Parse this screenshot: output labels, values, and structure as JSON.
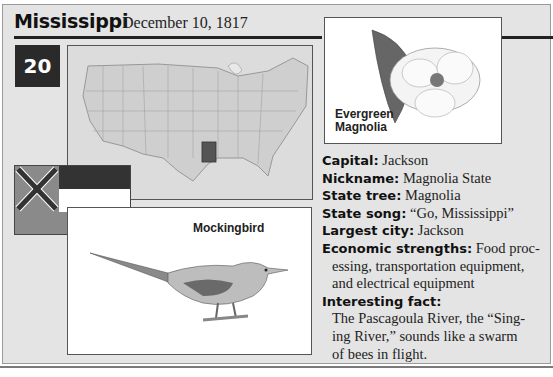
{
  "header": {
    "state_name": "Mississippi",
    "statehood_date": "December 10, 1817",
    "state_number": "20"
  },
  "images": {
    "map": {
      "description": "US map with Mississippi highlighted",
      "highlight_color": "#555555"
    },
    "flag": {
      "description": "Mississippi state flag"
    },
    "bird": {
      "label": "Mockingbird"
    },
    "flower": {
      "label_line1": "Evergreen",
      "label_line2": "Magnolia"
    }
  },
  "facts": {
    "capital": {
      "label": "Capital:",
      "value": "Jackson"
    },
    "nickname": {
      "label": "Nickname:",
      "value": "Magnolia State"
    },
    "state_tree": {
      "label": "State tree:",
      "value": "Magnolia"
    },
    "state_song": {
      "label": "State song:",
      "value": "“Go, Mississippi”"
    },
    "largest_city": {
      "label": "Largest city:",
      "value": "Jackson"
    },
    "economic_strengths": {
      "label": "Economic strengths:",
      "value_line1": "Food proc-",
      "value_line2": "essing, transportation equipment,",
      "value_line3": "and electrical equipment"
    },
    "interesting_fact": {
      "label": "Interesting fact:",
      "line1": "The Pascagoula River, the “Sing-",
      "line2": "ing River,” sounds like a swarm",
      "line3": "of bees in flight."
    }
  },
  "colors": {
    "card_bg": "#e4e4e4",
    "rule": "#222222",
    "number_box": "#2a2a2a"
  }
}
